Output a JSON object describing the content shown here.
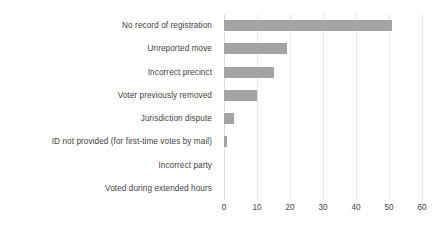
{
  "chart_data": {
    "type": "bar",
    "orientation": "horizontal",
    "title": "",
    "subtitle": "",
    "xlabel": "",
    "ylabel": "",
    "xlim": [
      0,
      60
    ],
    "xticks": [
      0,
      10,
      20,
      30,
      40,
      50,
      60
    ],
    "xtick_labels": [
      "0",
      "10",
      "20",
      "30",
      "40",
      "50",
      "60"
    ],
    "grid": true,
    "grid_axis": "x",
    "legend": false,
    "legend_position": "none",
    "bar_color": "#a3a3a3",
    "grid_color": "#e6e6e6",
    "text_color": "#3f3f3f",
    "background_color": "#ffffff",
    "categories": [
      "No record of registration",
      "Unreported move",
      "Incorrect precinct",
      "Voter previously removed",
      "Jurisdiction dispute",
      "ID not provided (for first-time votes by mail)",
      "Incorrect party",
      "Voted during extended hours"
    ],
    "values": [
      51,
      19,
      15,
      10,
      3,
      1,
      0,
      0
    ]
  }
}
